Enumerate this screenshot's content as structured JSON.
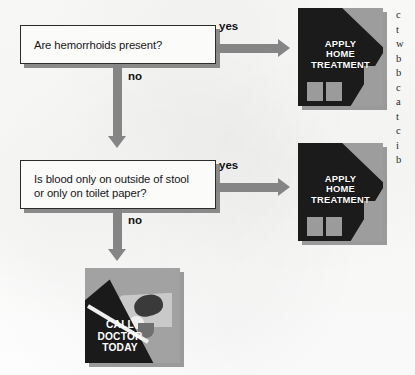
{
  "page": {
    "type": "medical-symptom-flowchart",
    "background_color": "#fdfdfc",
    "width": 415,
    "height": 375
  },
  "palette": {
    "ink": "#161616",
    "arrow_gray": "#858585",
    "box_fill": "#fbfbfa",
    "box_border": "#2b2b2b",
    "box_shadow": "#8a8a8a",
    "illustration_dark": "#1b1b1b",
    "illustration_gray": "#9d9d9d",
    "caption_text": "#ffffff"
  },
  "flowchart": {
    "nodes": [
      {
        "id": "q1",
        "kind": "decision",
        "text": "Are hemorrhoids present?"
      },
      {
        "id": "q2",
        "kind": "decision",
        "line1": "Is blood only on outside of stool",
        "line2": "or only on toilet paper?"
      }
    ],
    "edges": [
      {
        "id": "yes1",
        "label": "yes",
        "from": "q1",
        "to": "home1",
        "direction": "right"
      },
      {
        "id": "no1",
        "label": "no",
        "from": "q1",
        "to": "q2",
        "direction": "down"
      },
      {
        "id": "yes2",
        "label": "yes",
        "from": "q2",
        "to": "home2",
        "direction": "right"
      },
      {
        "id": "no2",
        "label": "no",
        "from": "q2",
        "to": "doctor",
        "direction": "down"
      }
    ],
    "outcomes": [
      {
        "id": "home1",
        "icon": "house-icon",
        "line1": "APPLY",
        "line2": "HOME",
        "line3": "TREATMENT"
      },
      {
        "id": "home2",
        "icon": "house-icon",
        "line1": "APPLY",
        "line2": "HOME",
        "line3": "TREATMENT"
      },
      {
        "id": "doctor",
        "icon": "telephone-hand-icon",
        "line1": "CALL",
        "line2": "DOCTOR",
        "line3": "TODAY"
      }
    ]
  },
  "margin_column": {
    "note": "adjacent body-text column clipped at the right page edge; only the first glyph of each line is legible",
    "lines": [
      "c",
      "t",
      "w",
      "b",
      "b",
      "c",
      "a",
      "t",
      "c",
      "i",
      "b"
    ]
  }
}
